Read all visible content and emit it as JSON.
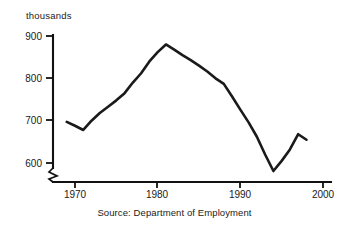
{
  "chart_data": {
    "type": "line",
    "title": "",
    "subtitle": "",
    "unit_label": "thousands",
    "xlabel": "",
    "ylabel": "thousands",
    "source_note": "Source: Department of Employment",
    "grid": false,
    "legend": "none",
    "xlim": [
      1967,
      2000
    ],
    "ylim": [
      570,
      900
    ],
    "y_axis_break": true,
    "y_axis_break_below": 600,
    "xticks": [
      1970,
      1980,
      1990,
      2000
    ],
    "xtick_labels": [
      "1970",
      "1980",
      "1990",
      "2000"
    ],
    "yticks": [
      600,
      700,
      800,
      900
    ],
    "ytick_labels": [
      "600",
      "700",
      "800",
      "900"
    ],
    "series": [
      {
        "name": "Employment",
        "color": "#1a1a1a",
        "x": [
          1969,
          1970,
          1971,
          1972,
          1973,
          1974,
          1975,
          1976,
          1977,
          1978,
          1979,
          1980,
          1981,
          1982,
          1983,
          1984,
          1985,
          1986,
          1987,
          1988,
          1989,
          1990,
          1991,
          1992,
          1993,
          1994,
          1995,
          1996,
          1997,
          1998
        ],
        "values": [
          697,
          688,
          678,
          700,
          718,
          733,
          748,
          765,
          790,
          812,
          840,
          862,
          880,
          868,
          855,
          843,
          830,
          816,
          800,
          787,
          757,
          726,
          696,
          662,
          620,
          581,
          605,
          632,
          668,
          655
        ]
      }
    ]
  }
}
